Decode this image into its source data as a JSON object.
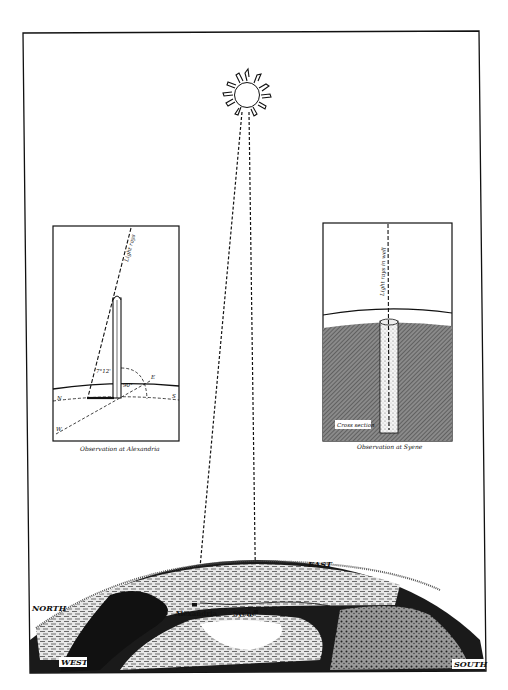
{
  "sun": {
    "icon": "sun-icon"
  },
  "alexandria_panel": {
    "caption": "Observation at Alexandria",
    "ray_label": "Light rays",
    "angle_label": "7°12'",
    "right_angle_label": "90°",
    "directions": {
      "north": "N",
      "south": "S",
      "east": "E",
      "west": "W"
    }
  },
  "syene_panel": {
    "caption": "Observation at Syene",
    "ray_label": "Light rays in well",
    "cross_section_label": "Cross section"
  },
  "globe": {
    "directions": {
      "north": "NORTH",
      "east": "EAST",
      "west": "WEST",
      "south": "SOUTH"
    },
    "places": {
      "alexandria": "Alexandria",
      "syene": "Syenê"
    }
  },
  "colors": {
    "ink": "#111111",
    "paper": "#ffffff",
    "shade": "#6a6a6a"
  }
}
